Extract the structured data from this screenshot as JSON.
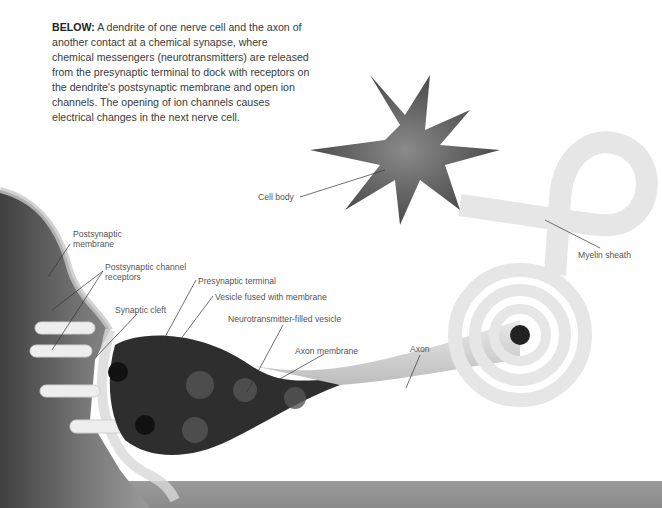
{
  "caption": {
    "lead": "BELOW:",
    "text": "A dendrite of one nerve cell and the axon of another contact at a chemical synapse, where chemical messengers (neurotransmitters) are released from the presynaptic terminal to dock with receptors on the dendrite's postsynaptic membrane and open ion channels. The opening of ion channels causes electrical changes in the next nerve cell."
  },
  "labels": {
    "cell_body": "Cell body",
    "myelin_sheath": "Myelin sheath",
    "postsynaptic_membrane_1": "Postsynaptic",
    "postsynaptic_membrane_2": "membrane",
    "postsynaptic_receptors_1": "Postsynaptic channel",
    "postsynaptic_receptors_2": "receptors",
    "presynaptic_terminal": "Presynaptic terminal",
    "vesicle_fused": "Vesicle fused with membrane",
    "synaptic_cleft": "Synaptic cleft",
    "nt_vesicle": "Neurotransmitter-filled vesicle",
    "axon_membrane": "Axon membrane",
    "axon": "Axon"
  },
  "colors": {
    "text": "#3a3a3a",
    "dendrite": "#5a5a5a",
    "cell_body": "#555555",
    "myelin": "#e4e4e4",
    "terminal": "#2a2a2a",
    "floor": "#909090"
  }
}
